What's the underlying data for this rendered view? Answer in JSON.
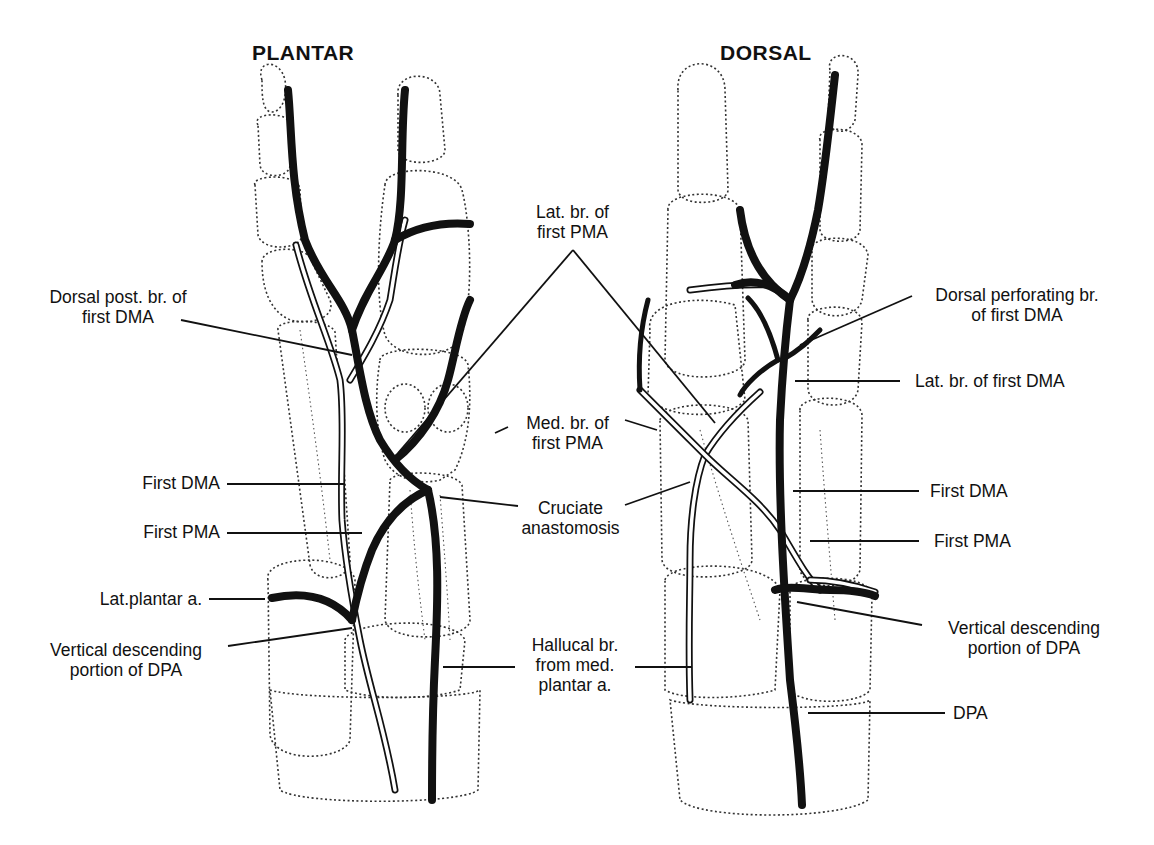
{
  "panels": {
    "plantar": {
      "title": "PLANTAR"
    },
    "dorsal": {
      "title": "DORSAL"
    }
  },
  "labels": {
    "plantar_dorsal_post_br_first_dma": {
      "line1": "Dorsal post. br. of",
      "line2": "first DMA"
    },
    "plantar_first_dma": "First DMA",
    "plantar_first_pma": "First PMA",
    "plantar_lat_plantar_a": "Lat.plantar a.",
    "plantar_vertical_descending_dpa": {
      "line1": "Vertical descending",
      "line2": "portion of DPA"
    },
    "center_lat_br_first_pma": {
      "line1": "Lat. br. of",
      "line2": "first PMA"
    },
    "center_med_br_first_pma": {
      "line1": "Med. br. of",
      "line2": "first PMA"
    },
    "center_cruciate_anastomosis": {
      "line1": "Cruciate",
      "line2": "anastomosis"
    },
    "center_hallucal_br": {
      "line1": "Hallucal br.",
      "line2": "from med.",
      "line3": "plantar a."
    },
    "dorsal_perforating_br_first_dma": {
      "line1": "Dorsal perforating br.",
      "line2": "of first DMA"
    },
    "dorsal_lat_br_first_dma": "Lat. br. of first DMA",
    "dorsal_first_dma": "First DMA",
    "dorsal_first_pma": "First PMA",
    "dorsal_vertical_descending_dpa": {
      "line1": "Vertical descending",
      "line2": "portion of DPA"
    },
    "dorsal_dpa": "DPA"
  },
  "colors": {
    "ink": "#111111",
    "background": "#ffffff"
  }
}
